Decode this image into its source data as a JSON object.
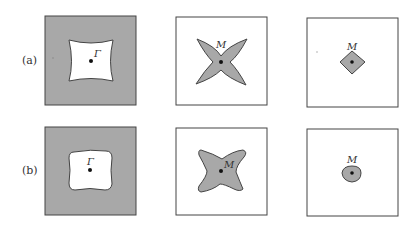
{
  "figure": {
    "rows": [
      {
        "label": "(a)",
        "panels": [
          {
            "type": "shaded-square-with-hole",
            "point_label": "Γ",
            "hole_shape": "concave-square"
          },
          {
            "type": "star",
            "point_label": "M",
            "shape": "four-point-star"
          },
          {
            "type": "small-diamond",
            "point_label": "M",
            "shape": "diamond"
          }
        ]
      },
      {
        "label": "(b)",
        "panels": [
          {
            "type": "shaded-square-with-hole",
            "point_label": "Γ",
            "hole_shape": "rounded-square"
          },
          {
            "type": "star",
            "point_label": "M",
            "shape": "rounded-four-point-star"
          },
          {
            "type": "small-blob",
            "point_label": "M",
            "shape": "rounded-diamond"
          }
        ]
      }
    ],
    "colors": {
      "fill": "#a8a8a8",
      "stroke": "#444444",
      "background": "#ffffff",
      "dot": "#111111"
    }
  }
}
